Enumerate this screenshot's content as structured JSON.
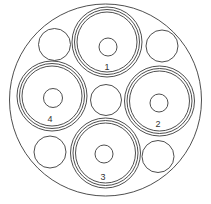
{
  "diagram": {
    "title": "",
    "colors": {
      "background": "#ffffff",
      "stroke": "#3a3a3a",
      "label": "#333333"
    },
    "outer_jacket": {
      "cx": 105.5,
      "cy": 100,
      "r": 96
    },
    "cores": [
      {
        "id": "1",
        "label": "1",
        "position": "top",
        "cx": 107,
        "cy": 42,
        "rings": [
          35,
          32.5,
          30
        ],
        "conductor": {
          "cx": 108,
          "cy": 47,
          "r": 9
        },
        "label_pos": {
          "x": 107,
          "y": 70
        }
      },
      {
        "id": "2",
        "label": "2",
        "position": "right",
        "cx": 159.5,
        "cy": 101,
        "rings": [
          35,
          32.5,
          30
        ],
        "conductor": {
          "cx": 159,
          "cy": 103,
          "r": 9
        },
        "label_pos": {
          "x": 158,
          "y": 127
        }
      },
      {
        "id": "3",
        "label": "3",
        "position": "bottom",
        "cx": 105.5,
        "cy": 153,
        "rings": [
          35,
          32.5,
          30
        ],
        "conductor": {
          "cx": 104,
          "cy": 154,
          "r": 9
        },
        "label_pos": {
          "x": 103,
          "y": 180
        }
      },
      {
        "id": "4",
        "label": "4",
        "position": "left",
        "cx": 52,
        "cy": 96,
        "rings": [
          35,
          32.5,
          30
        ],
        "conductor": {
          "cx": 53,
          "cy": 98,
          "r": 9.5
        },
        "label_pos": {
          "x": 50,
          "y": 122
        }
      }
    ],
    "fillers": [
      {
        "name": "filler-top-left",
        "cx": 54.5,
        "cy": 44.5,
        "r": 16
      },
      {
        "name": "filler-top-right",
        "cx": 162,
        "cy": 46,
        "r": 16
      },
      {
        "name": "filler-center",
        "cx": 106,
        "cy": 100,
        "r": 15.5
      },
      {
        "name": "filler-bottom-left",
        "cx": 50,
        "cy": 152,
        "r": 16
      },
      {
        "name": "filler-bottom-right",
        "cx": 158,
        "cy": 156.5,
        "r": 16
      }
    ]
  }
}
